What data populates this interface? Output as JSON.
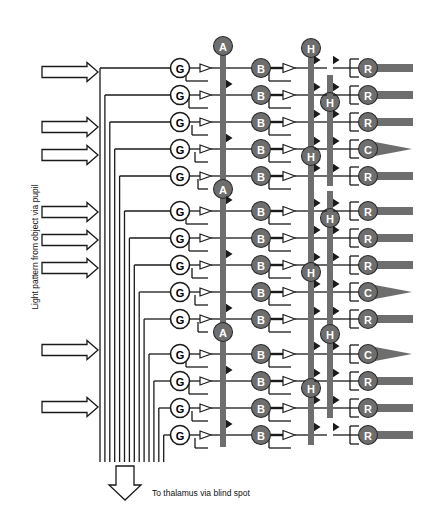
{
  "figure": {
    "background": "#ffffff",
    "width": 421,
    "height": 526
  },
  "labels": {
    "input_label": "Light pattern from object via pupil",
    "output_label": "To thalamus via blind spot"
  },
  "colors": {
    "line": "#1a1a1a",
    "cell_gray_fill": "#6e6e6e",
    "cell_gray_stroke": "#2b2b2b",
    "cell_white_fill": "#ffffff",
    "cell_white_stroke": "#1a1a1a",
    "cell_gray_text": "#ffffff",
    "cell_white_text": "#000000",
    "bar_fill": "#6e6e6e",
    "arrow_fill": "#ffffff",
    "arrow_stroke": "#1a1a1a",
    "text": "#111111"
  },
  "geometry": {
    "row_top": 68,
    "row_step": 27.0,
    "row_count": 14,
    "group_gap": 8.0,
    "g_col_x": 180,
    "a_col_x": 223,
    "b_col_x": 261,
    "h_col_a_x": 311,
    "h_col_b_x": 330,
    "r_col_x": 368,
    "cell_radius": 9.5,
    "bundle_left_x": 100,
    "bundle_right_x": 168,
    "bundle_bottom_y": 462
  },
  "input_arrows": [
    {
      "name": "light-arrow-1",
      "y": 72
    },
    {
      "name": "light-arrow-2",
      "y": 127
    },
    {
      "name": "light-arrow-3",
      "y": 155
    },
    {
      "name": "light-arrow-4",
      "y": 212
    },
    {
      "name": "light-arrow-5",
      "y": 240
    },
    {
      "name": "light-arrow-6",
      "y": 268
    },
    {
      "name": "light-arrow-7",
      "y": 350
    },
    {
      "name": "light-arrow-8",
      "y": 407
    }
  ],
  "output_arrow": {
    "name": "output-arrow",
    "x": 125,
    "y": 466
  },
  "columns": {
    "ganglion": {
      "label": "G",
      "name": "ganglion-cell-column",
      "style": "white",
      "cells": [
        "G",
        "G",
        "G",
        "G",
        "G",
        "G",
        "G",
        "G",
        "G",
        "G",
        "G",
        "G",
        "G",
        "G"
      ]
    },
    "amacrine": {
      "label": "A",
      "name": "amacrine-cell-column",
      "style": "gray",
      "cells": [
        {
          "label": "A",
          "row": 0
        },
        {
          "label": "A",
          "row": 5
        },
        {
          "label": "A",
          "row": 10
        }
      ],
      "bars": [
        {
          "name": "amacrine-bar-1",
          "row_start": 0,
          "row_end": 4
        },
        {
          "name": "amacrine-bar-2",
          "row_start": 5,
          "row_end": 9
        },
        {
          "name": "amacrine-bar-3",
          "row_start": 10,
          "row_end": 13
        }
      ]
    },
    "bipolar": {
      "label": "B",
      "name": "bipolar-cell-column",
      "style": "gray",
      "cells": [
        "B",
        "B",
        "B",
        "B",
        "B",
        "B",
        "B",
        "B",
        "B",
        "B",
        "B",
        "B",
        "B",
        "B"
      ]
    },
    "horizontal": {
      "label": "H",
      "name": "horizontal-cell-column",
      "style": "gray",
      "cells": [
        {
          "label": "H",
          "row": 0,
          "sub": "a"
        },
        {
          "label": "H",
          "row": 2,
          "sub": "b"
        },
        {
          "label": "H",
          "row": 4,
          "sub": "a"
        },
        {
          "label": "H",
          "row": 6,
          "sub": "b"
        },
        {
          "label": "H",
          "row": 8,
          "sub": "a"
        },
        {
          "label": "H",
          "row": 10,
          "sub": "b"
        },
        {
          "label": "H",
          "row": 12,
          "sub": "a"
        }
      ],
      "bars": [
        {
          "name": "horizontal-bar-a1",
          "sub": "a",
          "row_start": 0,
          "row_end": 3
        },
        {
          "name": "horizontal-bar-b1",
          "sub": "b",
          "row_start": 1,
          "row_end": 4
        },
        {
          "name": "horizontal-bar-a2",
          "sub": "a",
          "row_start": 4,
          "row_end": 7
        },
        {
          "name": "horizontal-bar-b2",
          "sub": "b",
          "row_start": 5,
          "row_end": 8
        },
        {
          "name": "horizontal-bar-a3",
          "sub": "a",
          "row_start": 8,
          "row_end": 11
        },
        {
          "name": "horizontal-bar-b3",
          "sub": "b",
          "row_start": 9,
          "row_end": 12
        },
        {
          "name": "horizontal-bar-a4",
          "sub": "a",
          "row_start": 12,
          "row_end": 13
        }
      ]
    },
    "receptor": {
      "label_rod": "R",
      "label_cone": "C",
      "name": "photoreceptor-column",
      "style": "gray",
      "cells": [
        "R",
        "R",
        "R",
        "C",
        "R",
        "R",
        "R",
        "R",
        "C",
        "R",
        "C",
        "R",
        "R",
        "R"
      ]
    }
  }
}
